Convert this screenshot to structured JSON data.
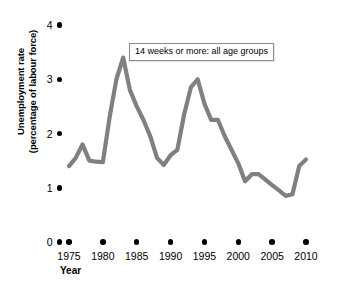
{
  "chart_data": {
    "type": "line",
    "title": "",
    "annotation": "14 weeks or more: all age groups",
    "xlabel": "Year",
    "ylabel_line1": "Unemployment rate",
    "ylabel_line2": "(percentage of labour force)",
    "xlim": [
      1975,
      2010
    ],
    "ylim": [
      0,
      4
    ],
    "xticks": [
      1975,
      1980,
      1985,
      1990,
      1995,
      2000,
      2005,
      2010
    ],
    "xtick_labels": [
      "1975",
      "1980",
      "1985",
      "1990",
      "1995",
      "2000",
      "2005",
      "2010"
    ],
    "yticks": [
      0,
      1,
      2,
      3,
      4
    ],
    "ytick_labels": [
      "0",
      "1",
      "2",
      "3",
      "4"
    ],
    "grid": false,
    "legend_position": "top-center-inside",
    "series_color": "#808080",
    "series": [
      {
        "name": "14 weeks or more: all age groups",
        "x": [
          1975,
          1976,
          1977,
          1978,
          1979,
          1980,
          1981,
          1982,
          1983,
          1984,
          1985,
          1986,
          1987,
          1988,
          1989,
          1990,
          1991,
          1992,
          1993,
          1994,
          1995,
          1996,
          1997,
          1998,
          1999,
          2000,
          2001,
          2002,
          2003,
          2004,
          2005,
          2006,
          2007,
          2008,
          2009,
          2010
        ],
        "values": [
          1.4,
          1.55,
          1.8,
          1.5,
          1.48,
          1.47,
          2.3,
          3.0,
          3.4,
          2.8,
          2.5,
          2.25,
          1.95,
          1.55,
          1.42,
          1.6,
          1.7,
          2.35,
          2.85,
          3.0,
          2.55,
          2.25,
          2.25,
          1.95,
          1.7,
          1.45,
          1.12,
          1.25,
          1.25,
          1.15,
          1.05,
          0.95,
          0.85,
          0.88,
          1.4,
          1.52
        ]
      }
    ]
  },
  "axes": {
    "y_dot_marker": "tick-dot",
    "x_dot_marker": "tick-dot"
  }
}
